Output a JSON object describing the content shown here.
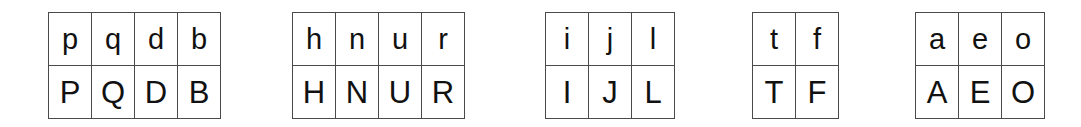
{
  "page": {
    "background_color": "#ffffff",
    "border_color": "#4a4a4a",
    "text_color": "#111111",
    "table_count": 5
  },
  "tables": [
    {
      "id": "table-1",
      "name": "descender-ascender-bowl-group",
      "columns": 4,
      "lowercase": [
        "p",
        "q",
        "d",
        "b"
      ],
      "uppercase": [
        "P",
        "Q",
        "D",
        "B"
      ]
    },
    {
      "id": "table-2",
      "name": "arch-group",
      "columns": 4,
      "lowercase": [
        "h",
        "n",
        "u",
        "r"
      ],
      "uppercase": [
        "H",
        "N",
        "U",
        "R"
      ]
    },
    {
      "id": "table-3",
      "name": "stem-group",
      "columns": 3,
      "lowercase": [
        "i",
        "j",
        "l"
      ],
      "uppercase": [
        "I",
        "J",
        "L"
      ]
    },
    {
      "id": "table-4",
      "name": "crossbar-group",
      "columns": 2,
      "lowercase": [
        "t",
        "f"
      ],
      "uppercase": [
        "T",
        "F"
      ]
    },
    {
      "id": "table-5",
      "name": "vowel-group",
      "columns": 3,
      "lowercase": [
        "a",
        "e",
        "o"
      ],
      "uppercase": [
        "A",
        "E",
        "O"
      ]
    }
  ]
}
